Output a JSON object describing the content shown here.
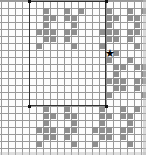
{
  "app": {
    "title": "Pattern Grid Editor",
    "view_name": "stitch-pattern-canvas"
  },
  "grid": {
    "columns": 21,
    "rows": 22,
    "cell_size_px": 7,
    "line_color": "#9a9a9a",
    "background_color": "#fdfdfd",
    "filled_color": "#8f8f8f"
  },
  "selection": {
    "label": "selection rectangle",
    "start_col": 4,
    "start_row": 0,
    "end_col": 14,
    "end_row": 14,
    "border_color": "#333333",
    "handles": [
      {
        "name": "handle-top-left"
      },
      {
        "name": "handle-top-right"
      },
      {
        "name": "handle-bottom-left"
      },
      {
        "name": "handle-bottom-right"
      }
    ]
  },
  "marker": {
    "name": "star-marker",
    "glyph": "★",
    "col": 15,
    "row": 7,
    "color": "#000000"
  },
  "filled_cells": [
    [
      6,
      1
    ],
    [
      9,
      1
    ],
    [
      11,
      1
    ],
    [
      15,
      1
    ],
    [
      18,
      1
    ],
    [
      20,
      1
    ],
    [
      6,
      2
    ],
    [
      7,
      2
    ],
    [
      9,
      2
    ],
    [
      10,
      2
    ],
    [
      15,
      2
    ],
    [
      16,
      2
    ],
    [
      18,
      2
    ],
    [
      19,
      2
    ],
    [
      6,
      3
    ],
    [
      10,
      3
    ],
    [
      15,
      3
    ],
    [
      19,
      3
    ],
    [
      5,
      4
    ],
    [
      6,
      4
    ],
    [
      7,
      4
    ],
    [
      9,
      4
    ],
    [
      10,
      4
    ],
    [
      14,
      4
    ],
    [
      15,
      4
    ],
    [
      16,
      4
    ],
    [
      18,
      4
    ],
    [
      19,
      4
    ],
    [
      6,
      5
    ],
    [
      7,
      5
    ],
    [
      9,
      5
    ],
    [
      15,
      5
    ],
    [
      16,
      5
    ],
    [
      18,
      5
    ],
    [
      5,
      6
    ],
    [
      10,
      6
    ],
    [
      14,
      6
    ],
    [
      19,
      6
    ],
    [
      16,
      7
    ],
    [
      15,
      8
    ],
    [
      18,
      8
    ],
    [
      16,
      9
    ],
    [
      17,
      9
    ],
    [
      19,
      9
    ],
    [
      20,
      9
    ],
    [
      16,
      10
    ],
    [
      20,
      10
    ],
    [
      15,
      11
    ],
    [
      16,
      11
    ],
    [
      17,
      11
    ],
    [
      19,
      11
    ],
    [
      20,
      11
    ],
    [
      16,
      12
    ],
    [
      17,
      12
    ],
    [
      19,
      12
    ],
    [
      15,
      13
    ],
    [
      20,
      13
    ],
    [
      6,
      15
    ],
    [
      9,
      15
    ],
    [
      14,
      15
    ],
    [
      17,
      15
    ],
    [
      19,
      15
    ],
    [
      6,
      16
    ],
    [
      7,
      16
    ],
    [
      9,
      16
    ],
    [
      10,
      16
    ],
    [
      14,
      16
    ],
    [
      15,
      16
    ],
    [
      17,
      16
    ],
    [
      18,
      16
    ],
    [
      6,
      17
    ],
    [
      10,
      17
    ],
    [
      14,
      17
    ],
    [
      18,
      17
    ],
    [
      5,
      18
    ],
    [
      6,
      18
    ],
    [
      7,
      18
    ],
    [
      9,
      18
    ],
    [
      10,
      18
    ],
    [
      13,
      18
    ],
    [
      14,
      18
    ],
    [
      15,
      18
    ],
    [
      17,
      18
    ],
    [
      18,
      18
    ],
    [
      6,
      19
    ],
    [
      7,
      19
    ],
    [
      9,
      19
    ],
    [
      14,
      19
    ],
    [
      15,
      19
    ],
    [
      17,
      19
    ],
    [
      5,
      20
    ],
    [
      10,
      20
    ],
    [
      13,
      20
    ],
    [
      18,
      20
    ]
  ]
}
